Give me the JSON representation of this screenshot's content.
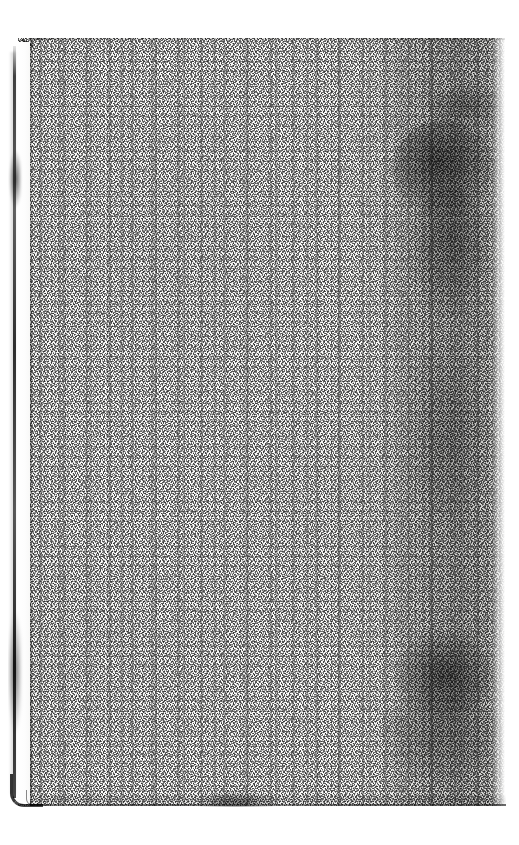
{
  "document": {
    "kind": "scanned-page",
    "description": "Scanned blank leaf of an old bound book",
    "page_content_text": "",
    "visible_text_lines": [],
    "canvas": {
      "width_px": 519,
      "height_px": 845,
      "background_color": "#ffffff"
    }
  },
  "leaf": {
    "name": "scanned-leaf",
    "left_px": 18,
    "top_px": 38,
    "width_px": 487,
    "height_px": 768,
    "paper_color": "#fdfdfc",
    "paper_tone_color": "#f6f6f4",
    "grain_color": "#3c3c3c",
    "texture": "dense-speckled-grain",
    "is_blank": true
  },
  "features": [
    {
      "id": "binding-gutter-line",
      "label": "Binding gutter line",
      "side": "left",
      "color": "#000000",
      "opacity": 0.8
    },
    {
      "id": "gutter-secondary-line",
      "label": "Inner board edge line",
      "side": "left",
      "color": "#000000",
      "opacity": 0.34
    },
    {
      "id": "rounded-corner",
      "label": "Rounded board corner",
      "position": "bottom-left",
      "color": "#000000",
      "opacity": 0.78
    },
    {
      "id": "soil-band",
      "label": "Dark soiling / shadow band",
      "side": "right",
      "color": "#000000",
      "opacity": 0.17
    },
    {
      "id": "blot-upper",
      "label": "Dark stain blotch (upper)",
      "side": "right",
      "color": "#000000",
      "opacity": 0.55
    },
    {
      "id": "blot-lower",
      "label": "Dark stain blotch (lower)",
      "side": "right",
      "color": "#000000",
      "opacity": 0.52
    },
    {
      "id": "bottom-edge-line",
      "label": "Bottom page edge",
      "side": "bottom",
      "color": "#000000",
      "opacity": 0.7
    },
    {
      "id": "top-edge-line",
      "label": "Top page edge",
      "side": "top",
      "color": "#000000",
      "opacity": 0.42
    },
    {
      "id": "corner-tick-top-left",
      "label": "Diagonal scratch mark",
      "position": "top-left",
      "color": "#000000",
      "opacity": 0.68
    }
  ],
  "scan_margin": {
    "label": "White scan border",
    "color": "#ffffff",
    "left_px": 8,
    "right_px": 13,
    "top_px": 37,
    "bottom_px": 38
  }
}
